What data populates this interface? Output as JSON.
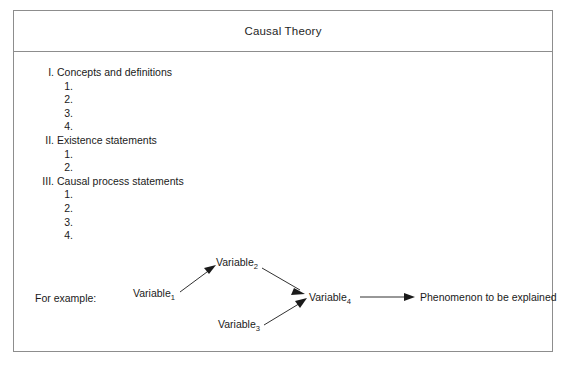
{
  "figure": {
    "title": "Causal Theory",
    "border_color": "#8d8d8d",
    "background_color": "#ffffff",
    "text_color": "#1a1a1a"
  },
  "outline": {
    "rows": [
      {
        "marker": "I.",
        "label": "Concepts and definitions",
        "level": 1
      },
      {
        "marker": "1.",
        "label": "",
        "level": 2
      },
      {
        "marker": "2.",
        "label": "",
        "level": 2
      },
      {
        "marker": "3.",
        "label": "",
        "level": 2
      },
      {
        "marker": "4.",
        "label": "",
        "level": 2
      },
      {
        "marker": "II.",
        "label": "Existence statements",
        "level": 1
      },
      {
        "marker": "1.",
        "label": "",
        "level": 2
      },
      {
        "marker": "2.",
        "label": "",
        "level": 2
      },
      {
        "marker": "III.",
        "label": "Causal process statements",
        "level": 1
      },
      {
        "marker": "1.",
        "label": "",
        "level": 2
      },
      {
        "marker": "2.",
        "label": "",
        "level": 2
      },
      {
        "marker": "3.",
        "label": "",
        "level": 2
      },
      {
        "marker": "4.",
        "label": "",
        "level": 2
      }
    ]
  },
  "example": {
    "label": "For example:",
    "nodes": {
      "v1": {
        "base": "Variable",
        "sub": "1"
      },
      "v2": {
        "base": "Variable",
        "sub": "2"
      },
      "v3": {
        "base": "Variable",
        "sub": "3"
      },
      "v4": {
        "base": "Variable",
        "sub": "4"
      },
      "outcome": {
        "base": "Phenomenon to be explained",
        "sub": ""
      }
    }
  }
}
